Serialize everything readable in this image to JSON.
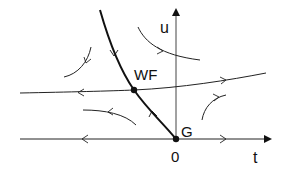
{
  "diagram": {
    "type": "phase-portrait",
    "axes": {
      "x_label": "t",
      "y_label": "u",
      "origin_label": "0"
    },
    "points": [
      {
        "id": "WF",
        "label": "WF",
        "x": 134,
        "y": 90
      },
      {
        "id": "G",
        "label": "G",
        "x": 176,
        "y": 139
      }
    ],
    "colors": {
      "ink": "#111111",
      "axis": "#333333",
      "background": "#ffffff"
    }
  }
}
